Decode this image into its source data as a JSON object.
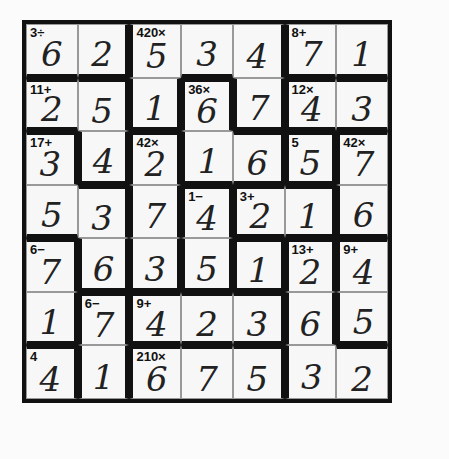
{
  "puzzle": {
    "size": 7,
    "rows": [
      [
        "6",
        "2",
        "5",
        "3",
        "4",
        "7",
        "1"
      ],
      [
        "2",
        "5",
        "1",
        "6",
        "7",
        "4",
        "3"
      ],
      [
        "3",
        "4",
        "2",
        "1",
        "6",
        "5",
        "7"
      ],
      [
        "5",
        "3",
        "7",
        "4",
        "2",
        "1",
        "6"
      ],
      [
        "7",
        "6",
        "3",
        "5",
        "1",
        "2",
        "4"
      ],
      [
        "1",
        "7",
        "4",
        "2",
        "3",
        "6",
        "5"
      ],
      [
        "4",
        "1",
        "6",
        "7",
        "5",
        "3",
        "2"
      ]
    ],
    "clues": [
      [
        "3÷",
        "",
        "420×",
        "",
        "",
        "8+",
        ""
      ],
      [
        "11+",
        "",
        "",
        "36×",
        "",
        "12×",
        ""
      ],
      [
        "17+",
        "",
        "42×",
        "",
        "",
        "5",
        "42×"
      ],
      [
        "",
        "",
        "",
        "1−",
        "3+",
        "",
        ""
      ],
      [
        "6−",
        "",
        "",
        "",
        "",
        "13+",
        "9+"
      ],
      [
        "",
        "6−",
        "9+",
        "",
        "",
        "",
        ""
      ],
      [
        "4",
        "",
        "210×",
        "",
        "",
        "",
        ""
      ]
    ]
  }
}
